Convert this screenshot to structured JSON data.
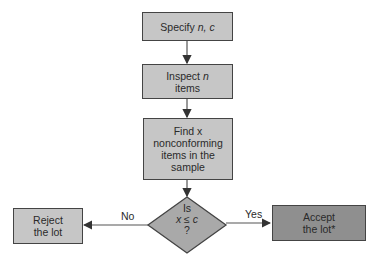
{
  "nodes": {
    "specify": {
      "text_pre": "Specify ",
      "var": "n, c"
    },
    "inspect": {
      "line1_pre": "Inspect ",
      "line1_var": "n",
      "line2": "items"
    },
    "find": {
      "text": "Find x nonconforming items in the sample"
    },
    "decision": {
      "line1": "Is",
      "line2": "x ≤ c",
      "line3": "?"
    },
    "reject": {
      "line1": "Reject",
      "line2": "the lot"
    },
    "accept": {
      "line1": "Accept",
      "line2": "the lot*"
    }
  },
  "edges": {
    "no_label": "No",
    "yes_label": "Yes"
  },
  "colors": {
    "box_light": "#c6c6c6",
    "box_dark": "#8f8f8f",
    "diamond": "#a9a9a9",
    "line": "#444444"
  }
}
